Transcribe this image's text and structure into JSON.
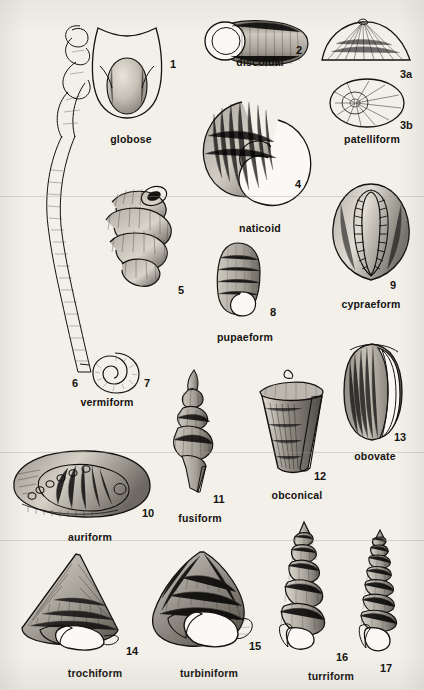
{
  "plate": {
    "background_color": "#f3f0ea",
    "ink_color": "#141210",
    "subject": "gastropod shell form types"
  },
  "figures": [
    {
      "id": "globose",
      "number": "1",
      "caption": "globose",
      "num_x": 170,
      "num_y": 58,
      "cap_x": 131,
      "cap_y": 116
    },
    {
      "id": "discoidal",
      "number": "2",
      "caption": "discoidal",
      "num_x": 296,
      "num_y": 44,
      "cap_x": 260,
      "cap_y": 56
    },
    {
      "id": "patelliform-a",
      "number": "3a",
      "caption": "",
      "num_x": 402,
      "num_y": 72,
      "cap_x": 0,
      "cap_y": 0
    },
    {
      "id": "patelliform-b",
      "number": "3b",
      "caption": "patelliform",
      "num_x": 402,
      "num_y": 123,
      "cap_x": 372,
      "cap_y": 138
    },
    {
      "id": "naticoid",
      "number": "4",
      "caption": "naticoid",
      "num_x": 295,
      "num_y": 182,
      "cap_x": 260,
      "cap_y": 222
    },
    {
      "id": "vermiform-5",
      "number": "5",
      "caption": "",
      "num_x": 178,
      "num_y": 288,
      "cap_x": 0,
      "cap_y": 0
    },
    {
      "id": "vermiform-6",
      "number": "6",
      "caption": "vermiform",
      "num_x": 72,
      "num_y": 381,
      "cap_x": 107,
      "cap_y": 399
    },
    {
      "id": "vermiform-7",
      "number": "7",
      "caption": "",
      "num_x": 144,
      "num_y": 381,
      "cap_x": 0,
      "cap_y": 0
    },
    {
      "id": "pupaeform",
      "number": "8",
      "caption": "pupaeform",
      "num_x": 270,
      "num_y": 310,
      "cap_x": 245,
      "cap_y": 334
    },
    {
      "id": "cypraeform",
      "number": "9",
      "caption": "cypraeform",
      "num_x": 390,
      "num_y": 283,
      "cap_x": 371,
      "cap_y": 303
    },
    {
      "id": "auriform",
      "number": "10",
      "caption": "auriform",
      "num_x": 143,
      "num_y": 511,
      "cap_x": 90,
      "cap_y": 534
    },
    {
      "id": "fusiform",
      "number": "11",
      "caption": "fusiform",
      "num_x": 214,
      "num_y": 497,
      "cap_x": 200,
      "cap_y": 515
    },
    {
      "id": "obconical",
      "number": "12",
      "caption": "obconical",
      "num_x": 315,
      "num_y": 474,
      "cap_x": 297,
      "cap_y": 492
    },
    {
      "id": "obovate",
      "number": "13",
      "caption": "obovate",
      "num_x": 395,
      "num_y": 435,
      "cap_x": 375,
      "cap_y": 454
    },
    {
      "id": "trochiform",
      "number": "14",
      "caption": "trochiform",
      "num_x": 127,
      "num_y": 650,
      "cap_x": 95,
      "cap_y": 670
    },
    {
      "id": "turbiniform",
      "number": "15",
      "caption": "turbiniform",
      "num_x": 250,
      "num_y": 645,
      "cap_x": 209,
      "cap_y": 670
    },
    {
      "id": "turriform",
      "number": "16",
      "caption": "turriform",
      "num_x": 337,
      "num_y": 655,
      "cap_x": 331,
      "cap_y": 673
    },
    {
      "id": "turriform-17",
      "number": "17",
      "caption": "",
      "num_x": 381,
      "num_y": 666,
      "cap_x": 0,
      "cap_y": 0
    }
  ]
}
